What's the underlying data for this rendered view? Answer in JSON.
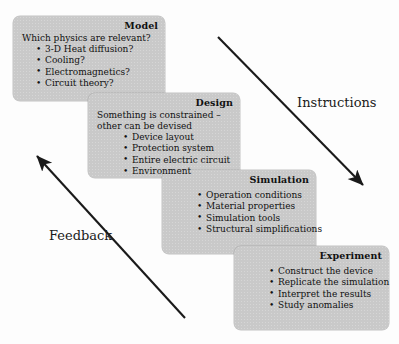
{
  "diagram": {
    "card_color": "#c9c9c9",
    "text_color": "#111111",
    "arrow_color": "#1a1a1a"
  },
  "cards": [
    {
      "id": "model",
      "title": "Model",
      "lead": "Which physics are relevant?",
      "items": [
        "3-D Heat diffusion?",
        "Cooling?",
        "Electromagnetics?",
        "Circuit theory?"
      ]
    },
    {
      "id": "design",
      "title": "Design",
      "lead": "Something is constrained –\nother can be devised",
      "items": [
        "Device layout",
        "Protection system",
        "Entire electric circuit",
        "Environment"
      ]
    },
    {
      "id": "simulation",
      "title": "Simulation",
      "lead": "",
      "items": [
        "Operation conditions",
        "Material properties",
        "Simulation tools",
        "Structural simplifications"
      ]
    },
    {
      "id": "experiment",
      "title": "Experiment",
      "lead": "",
      "items": [
        "Construct the device",
        "Replicate the simulation",
        "Interpret the results",
        "Study anomalies"
      ]
    }
  ],
  "arrows": [
    {
      "id": "instructions",
      "label": "Instructions",
      "direction": "down-right",
      "from": [
        218,
        37
      ],
      "to": [
        366,
        188
      ]
    },
    {
      "id": "feedback",
      "label": "Feedback",
      "direction": "up-left",
      "from": [
        185,
        318
      ],
      "to": [
        34,
        153
      ]
    }
  ]
}
